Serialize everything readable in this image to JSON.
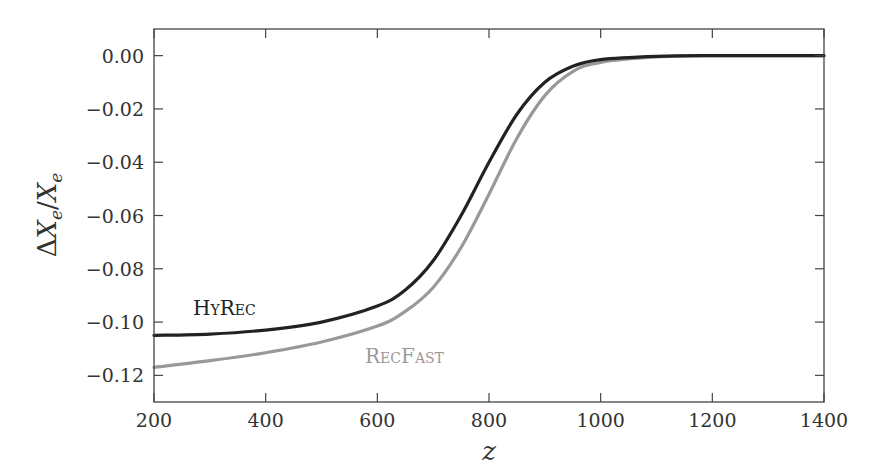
{
  "chart_data": {
    "type": "line",
    "title": "",
    "xlabel": "z",
    "ylabel": "ΔX_e / X_e",
    "xlim": [
      200,
      1400
    ],
    "ylim": [
      -0.13,
      0.01
    ],
    "grid": false,
    "legend": "inline labels",
    "x_ticks": [
      200,
      400,
      600,
      800,
      1000,
      1200,
      1400
    ],
    "x_tick_labels": [
      "200",
      "400",
      "600",
      "800",
      "1000",
      "1200",
      "1400"
    ],
    "y_ticks": [
      0.0,
      -0.02,
      -0.04,
      -0.06,
      -0.08,
      -0.1,
      -0.12
    ],
    "y_tick_labels": [
      "0.00",
      "−0.02",
      "−0.04",
      "−0.06",
      "−0.08",
      "−0.10",
      "−0.12"
    ],
    "x": [
      200,
      300,
      400,
      500,
      600,
      650,
      700,
      750,
      800,
      850,
      900,
      950,
      1000,
      1100,
      1200,
      1300,
      1400
    ],
    "series": [
      {
        "name": "HyRec",
        "label": "HyRec",
        "color": "#222222",
        "values": [
          -0.105,
          -0.1045,
          -0.103,
          -0.1,
          -0.094,
          -0.088,
          -0.077,
          -0.06,
          -0.04,
          -0.022,
          -0.01,
          -0.004,
          -0.0015,
          -0.0003,
          0.0,
          0.0,
          0.0
        ],
        "label_pos": {
          "z": 270,
          "y": -0.0975
        }
      },
      {
        "name": "RecFast",
        "label": "RecFast",
        "color": "#999999",
        "values": [
          -0.117,
          -0.1145,
          -0.1115,
          -0.1075,
          -0.1015,
          -0.096,
          -0.087,
          -0.072,
          -0.052,
          -0.031,
          -0.015,
          -0.006,
          -0.0025,
          -0.0005,
          0.0,
          0.0,
          0.0
        ],
        "label_pos": {
          "z": 578,
          "y": -0.1155
        }
      }
    ]
  },
  "ylabel_parts": {
    "delta": "Δ",
    "x": "X",
    "sub": "e",
    "slash": "/",
    "x2": "X",
    "sub2": "e"
  },
  "colors": {
    "axis": "#444444",
    "hyrec": "#222222",
    "recfast": "#999999"
  }
}
